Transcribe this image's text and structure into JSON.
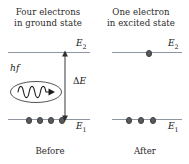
{
  "diagram": {
    "colors": {
      "level_line": "#8f96a3",
      "electron_dot": "#58595b",
      "text": "#1a1a1a",
      "background": "#ffffff"
    },
    "panels": {
      "left": {
        "title_line1": "Four electrons",
        "title_line2": "in ground state",
        "caption": "Before",
        "upper_level_label": "E",
        "upper_level_sub": "2",
        "lower_level_label": "E",
        "lower_level_sub": "1",
        "electrons_upper": 0,
        "electrons_lower": 4,
        "electron_lower_x": [
          28,
          39,
          50,
          61
        ],
        "photon_label": "hf",
        "gap_label_delta": "Δ",
        "gap_label_e": "E",
        "wave_cycles": 3.5,
        "arrow_direction": "right"
      },
      "right": {
        "title_line1": "One electron",
        "title_line2": "in excited state",
        "caption": "After",
        "upper_level_label": "E",
        "upper_level_sub": "2",
        "lower_level_label": "E",
        "lower_level_sub": "1",
        "electrons_upper": 1,
        "electrons_lower": 3,
        "electron_upper_x": [
          148
        ],
        "electron_lower_x": [
          128,
          140,
          152
        ]
      }
    }
  }
}
